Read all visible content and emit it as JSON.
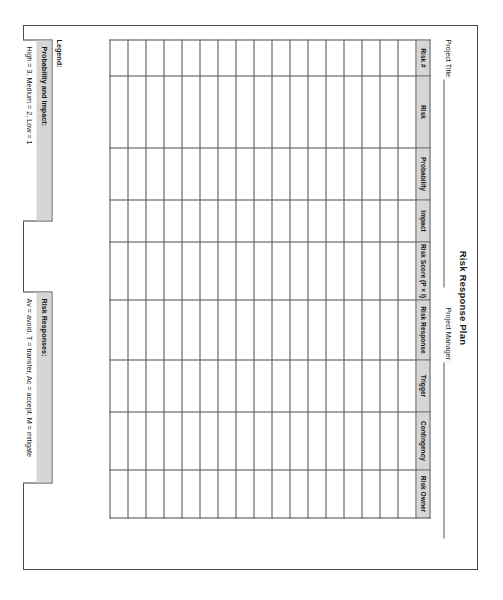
{
  "document": {
    "title": "Risk Response Plan",
    "orientation_degrees": 90,
    "fields": [
      {
        "label": "Project Title:",
        "value": ""
      },
      {
        "label": "Project Manager:",
        "value": ""
      }
    ]
  },
  "table": {
    "columns": [
      "Risk #",
      "Risk",
      "Probability",
      "Impact",
      "Risk Score (P × I)",
      "Risk Response",
      "Trigger",
      "Contingency",
      "Risk Owner"
    ],
    "row_count": 17,
    "rows_are_blank": true
  },
  "legend": {
    "label": "Legend:",
    "boxes": [
      {
        "heading": "Probability and Impact:",
        "body": "High = 3, Medium = 2, Low = 1"
      },
      {
        "heading": "Risk Responses:",
        "body": "Av = avoid, T = transfer, Ac = accept, M = mitigate"
      }
    ]
  },
  "style": {
    "page_background": "#ffffff",
    "page_border": "#4a4a4a",
    "header_fill": "#d6d6d6",
    "grid_line": "#4d4d4d",
    "text": "#151515"
  }
}
